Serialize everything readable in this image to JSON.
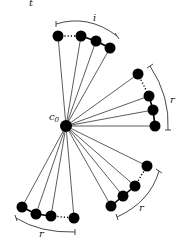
{
  "figure_label": "t",
  "center": {
    "label": "c",
    "subscript": "0",
    "x": 66,
    "y": 126
  },
  "groups": [
    {
      "name": "top",
      "label": "i",
      "nodes": [
        [
          58,
          36
        ],
        [
          81,
          36
        ],
        [
          96,
          41
        ],
        [
          110,
          48
        ]
      ],
      "dots_between": [
        0,
        1
      ],
      "brace": "M56,24 Q88,14 117,36",
      "brace_ticks": [
        [
          56,
          21,
          56,
          27
        ],
        [
          115,
          33,
          119,
          39
        ]
      ],
      "label_pos": [
        93,
        21
      ]
    },
    {
      "name": "right",
      "label": "r",
      "nodes": [
        [
          138,
          74
        ],
        [
          149,
          96
        ],
        [
          153,
          110
        ],
        [
          155,
          126
        ]
      ],
      "dots_between": [
        0,
        1
      ],
      "brace": "M150,66 Q170,96 168,130",
      "brace_ticks": [
        [
          147,
          68,
          153,
          64
        ],
        [
          165,
          130,
          171,
          130
        ]
      ],
      "label_pos": [
        170,
        103
      ]
    },
    {
      "name": "bottom-right",
      "label": "r",
      "nodes": [
        [
          147,
          166
        ],
        [
          135,
          186
        ],
        [
          123,
          196
        ],
        [
          111,
          206
        ]
      ],
      "dots_between": [
        0,
        1
      ],
      "brace": "M159,171 Q150,202 117,217",
      "brace_ticks": [
        [
          156,
          169,
          162,
          173
        ],
        [
          116,
          214,
          118,
          220
        ]
      ],
      "label_pos": [
        139,
        211
      ]
    },
    {
      "name": "bottom-left",
      "label": "r",
      "nodes": [
        [
          22,
          207
        ],
        [
          36,
          214
        ],
        [
          51,
          216
        ],
        [
          74,
          218
        ]
      ],
      "dots_between": [
        2,
        3
      ],
      "brace": "M16,218 Q40,233 75,232",
      "brace_ticks": [
        [
          15,
          215,
          17,
          221
        ],
        [
          75,
          229,
          75,
          235
        ]
      ],
      "label_pos": [
        39,
        237
      ]
    }
  ],
  "node_radius": 5.5
}
